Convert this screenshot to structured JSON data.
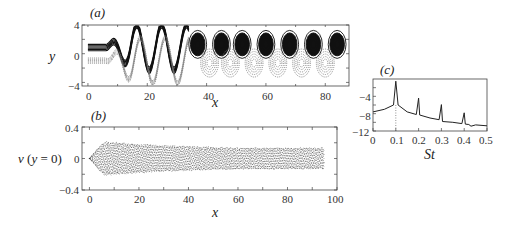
{
  "chart_data": [
    {
      "id": "a",
      "type": "heatmap",
      "panel_label": "(a)",
      "description": "Vorticity contour plot: solid contours (positive) and dotted contours (negative) forming a staggered vortex street",
      "xlabel": "x",
      "ylabel": "y",
      "xlim": [
        -2,
        88
      ],
      "ylim": [
        -4.5,
        4
      ],
      "xticks": [
        "0",
        "20",
        "40",
        "60",
        "80"
      ],
      "yticks": [
        "4",
        "0",
        "-4"
      ],
      "vortex_centers_positive_x": [
        37,
        45,
        52,
        60,
        68,
        76,
        84
      ],
      "vortex_centers_negative_x": [
        41,
        48,
        56,
        64,
        72,
        80
      ],
      "vortex_positive_y": 1.3,
      "vortex_negative_y": -1.3
    },
    {
      "id": "b",
      "type": "line",
      "panel_label": "(b)",
      "description": "Centreline transverse velocity v(y=0) vs x, dense oscillating envelope",
      "xlabel": "x",
      "ylabel": "v (y = 0)",
      "xlim": [
        -3,
        100
      ],
      "ylim": [
        -0.4,
        0.4
      ],
      "xticks": [
        "0",
        "20",
        "40",
        "60",
        "80",
        "100"
      ],
      "yticks": [
        "0.4",
        "0",
        "-0.4"
      ],
      "envelope": {
        "x": [
          0,
          3,
          6,
          20,
          40,
          60,
          80,
          95
        ],
        "amplitude": [
          0.0,
          0.12,
          0.22,
          0.19,
          0.16,
          0.14,
          0.14,
          0.14
        ]
      }
    },
    {
      "id": "c",
      "type": "line",
      "panel_label": "(c)",
      "description": "Power spectrum vs Strouhal number with peaks at harmonics",
      "xlabel": "St",
      "ylabel": "",
      "xlim": [
        0,
        0.5
      ],
      "ylim": [
        -12,
        0
      ],
      "xticks": [
        "0",
        "0.1",
        "0.2",
        "0.3",
        "0.4",
        "0.5"
      ],
      "yticks": [
        "-4",
        "-8",
        "-12"
      ],
      "grid": false,
      "vertical_dotted_line_at": 0.1,
      "series": [
        {
          "name": "spectrum",
          "x": [
            0,
            0.05,
            0.09,
            0.1,
            0.11,
            0.15,
            0.19,
            0.2,
            0.205,
            0.25,
            0.29,
            0.3,
            0.305,
            0.35,
            0.39,
            0.4,
            0.405,
            0.42,
            0.43,
            0.45,
            0.5
          ],
          "values": [
            -7.6,
            -7.0,
            -6.0,
            -0.5,
            -6.0,
            -7.6,
            -8.2,
            -4.4,
            -8.3,
            -9.0,
            -9.4,
            -5.9,
            -9.8,
            -10.0,
            -10.3,
            -7.8,
            -10.4,
            -10.5,
            -10.9,
            -10.6,
            -10.8
          ]
        }
      ],
      "peaks": [
        {
          "St": 0.1,
          "value": -0.5
        },
        {
          "St": 0.2,
          "value": -4.4
        },
        {
          "St": 0.3,
          "value": -5.9
        },
        {
          "St": 0.4,
          "value": -7.8
        }
      ]
    }
  ],
  "labels": {
    "a": "(a)",
    "b": "(b)",
    "c": "(c)",
    "a_xlabel": "x",
    "a_ylabel": "y",
    "b_xlabel": "x",
    "b_ylabel": "v (y = 0)",
    "c_xlabel": "St"
  },
  "ticks": {
    "a_x": [
      "0",
      "20",
      "40",
      "60",
      "80"
    ],
    "a_y": [
      "4",
      "0",
      "−4"
    ],
    "b_x": [
      "0",
      "20",
      "40",
      "60",
      "80",
      "100"
    ],
    "b_y": [
      "0.4",
      "0",
      "−0.4"
    ],
    "c_x": [
      "0",
      "0.1",
      "0.2",
      "0.3",
      "0.4",
      "0.5"
    ],
    "c_y": [
      "−4",
      "−8",
      "−12"
    ]
  }
}
